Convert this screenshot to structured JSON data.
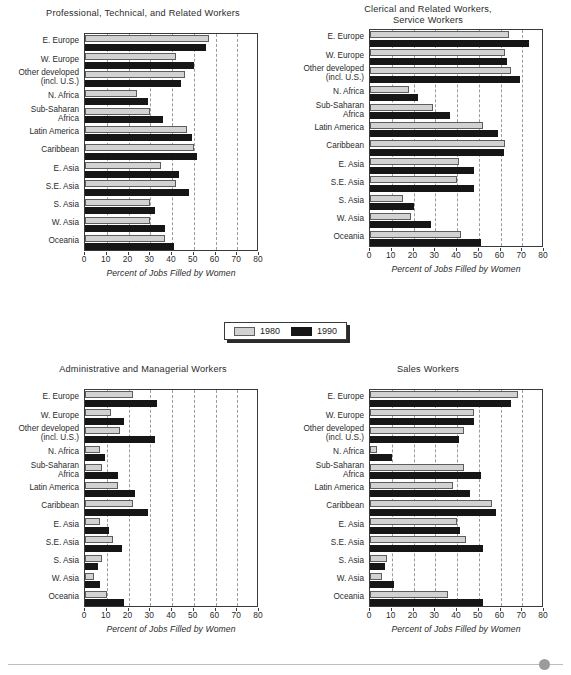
{
  "legend": {
    "items": [
      {
        "label": "1980",
        "color": "#d2d2d2"
      },
      {
        "label": "1990",
        "color": "#161616"
      }
    ]
  },
  "footer": {
    "dot_color": "#9b9b9b"
  },
  "axis": {
    "xlabel": "Percent of Jobs Filled by Women",
    "ticks": [
      "0",
      "10",
      "20",
      "30",
      "40",
      "50",
      "60",
      "70",
      "80"
    ],
    "xmin": 0,
    "xmax": 80
  },
  "categories": [
    "E. Europe",
    "W. Europe",
    "Other developed\n(incl. U.S.)",
    "N. Africa",
    "Sub-Saharan\nAfrica",
    "Latin America",
    "Caribbean",
    "E. Asia",
    "S.E. Asia",
    "S. Asia",
    "W. Asia",
    "Oceania"
  ],
  "chart_data": [
    {
      "type": "bar",
      "title": "Professional, Technical, and Related Workers",
      "xlabel": "Percent of Jobs Filled by Women",
      "ylabel": "",
      "xlim": [
        0,
        80
      ],
      "grid": true,
      "orientation": "horizontal",
      "legend_position": "center-between-panels",
      "categories": [
        "E. Europe",
        "W. Europe",
        "Other developed (incl. U.S.)",
        "N. Africa",
        "Sub-Saharan Africa",
        "Latin America",
        "Caribbean",
        "E. Asia",
        "S.E. Asia",
        "S. Asia",
        "W. Asia",
        "Oceania"
      ],
      "series": [
        {
          "name": "1980",
          "values": [
            57,
            42,
            46,
            24,
            30,
            47,
            50,
            35,
            42,
            30,
            30,
            37
          ]
        },
        {
          "name": "1990",
          "values": [
            55.5,
            50,
            44,
            29,
            36,
            49,
            51.5,
            43,
            48,
            32,
            37,
            41
          ]
        }
      ]
    },
    {
      "type": "bar",
      "title": "Clerical and Related Workers,\nService Workers",
      "xlabel": "Percent of Jobs Filled by Women",
      "ylabel": "",
      "xlim": [
        0,
        80
      ],
      "grid": true,
      "orientation": "horizontal",
      "categories": [
        "E. Europe",
        "W. Europe",
        "Other developed (incl. U.S.)",
        "N. Africa",
        "Sub-Saharan Africa",
        "Latin America",
        "Caribbean",
        "E. Asia",
        "S.E. Asia",
        "S. Asia",
        "W. Asia",
        "Oceania"
      ],
      "series": [
        {
          "name": "1980",
          "values": [
            64,
            62,
            65,
            18,
            29,
            52,
            62,
            41,
            40,
            15,
            19,
            42
          ]
        },
        {
          "name": "1990",
          "values": [
            73,
            63,
            69,
            22,
            37,
            59,
            61.5,
            48,
            48,
            20,
            28,
            51
          ]
        }
      ]
    },
    {
      "type": "bar",
      "title": "Administrative and Managerial Workers",
      "xlabel": "Percent of Jobs Filled by Women",
      "ylabel": "",
      "xlim": [
        0,
        80
      ],
      "grid": true,
      "orientation": "horizontal",
      "categories": [
        "E. Europe",
        "W. Europe",
        "Other developed (incl. U.S.)",
        "N. Africa",
        "Sub-Saharan Africa",
        "Latin America",
        "Caribbean",
        "E. Asia",
        "S.E. Asia",
        "S. Asia",
        "W. Asia",
        "Oceania"
      ],
      "series": [
        {
          "name": "1980",
          "values": [
            22,
            12,
            16,
            7,
            8,
            15,
            22,
            7,
            13,
            8,
            4,
            10
          ]
        },
        {
          "name": "1990",
          "values": [
            33,
            18,
            32,
            9,
            15,
            23,
            29,
            11,
            17,
            6,
            7,
            18
          ]
        }
      ]
    },
    {
      "type": "bar",
      "title": "Sales Workers",
      "xlabel": "Percent of Jobs Filled by Women",
      "ylabel": "",
      "xlim": [
        0,
        80
      ],
      "grid": true,
      "orientation": "horizontal",
      "categories": [
        "E. Europe",
        "W. Europe",
        "Other developed (incl. U.S.)",
        "N. Africa",
        "Sub-Saharan Africa",
        "Latin America",
        "Caribbean",
        "E. Asia",
        "S.E. Asia",
        "S. Asia",
        "W. Asia",
        "Oceania"
      ],
      "series": [
        {
          "name": "1980",
          "values": [
            68,
            48,
            43,
            3,
            43,
            38,
            56,
            40,
            44,
            8,
            5.5,
            36
          ]
        },
        {
          "name": "1990",
          "values": [
            65,
            48,
            41,
            10,
            51,
            46,
            58,
            41.5,
            52,
            7,
            11,
            52
          ]
        }
      ]
    }
  ]
}
